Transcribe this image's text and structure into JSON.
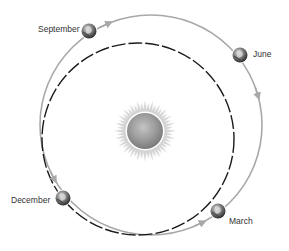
{
  "diagram": {
    "title": "",
    "colors": {
      "outer_orbit": "#a8a8a8",
      "inner_orbit": "#1a1a1a",
      "sun_core": "#9a9a9a",
      "sun_rays": "#cfcfcf",
      "earth_dark": "#3a3a3a",
      "earth_light": "#d8d8d8",
      "label": "#333333"
    },
    "sun": {
      "cx": 145,
      "cy": 131,
      "core_r": 18,
      "ray_r": 31
    },
    "outer_orbit": {
      "cx": 151,
      "cy": 125,
      "rx": 111,
      "ry": 110,
      "style": "solid",
      "direction": "counterclockwise"
    },
    "inner_orbit": {
      "cx": 138,
      "cy": 139,
      "r": 96,
      "style": "dashed"
    },
    "earths": [
      {
        "id": "september",
        "label": "September",
        "cx": 89,
        "cy": 31,
        "label_x": 38,
        "label_y": 25
      },
      {
        "id": "june",
        "label": "June",
        "cx": 240,
        "cy": 55,
        "label_x": 253,
        "label_y": 50
      },
      {
        "id": "december",
        "label": "December",
        "cx": 63,
        "cy": 198,
        "label_x": 11,
        "label_y": 196
      },
      {
        "id": "march",
        "label": "March",
        "cx": 218,
        "cy": 211,
        "label_x": 229,
        "label_y": 217
      }
    ]
  }
}
